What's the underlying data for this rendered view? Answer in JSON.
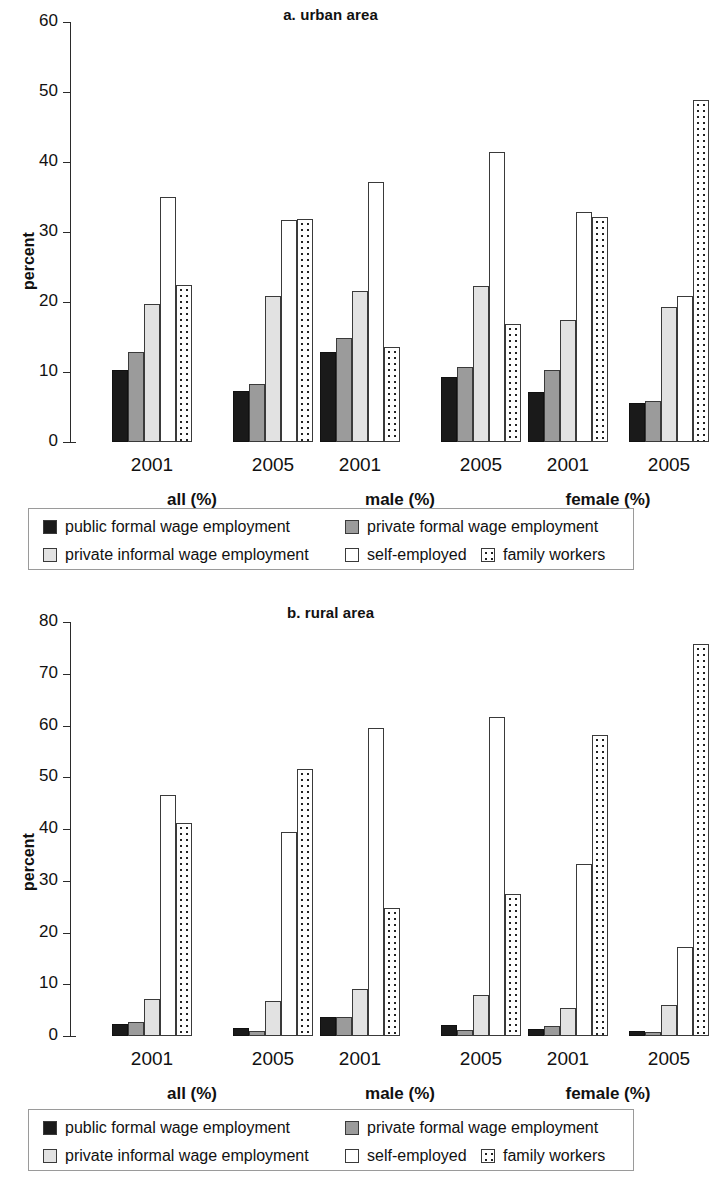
{
  "figure": {
    "ylabel": "percent",
    "series_names": [
      "public formal wage employment",
      "private formal wage employment",
      "private informal wage employment",
      "self-employed",
      "family workers"
    ],
    "series_swatches": [
      "s0",
      "s1",
      "s2",
      "s3",
      "s4"
    ],
    "group_labels": [
      "all (%)",
      "male (%)",
      "female (%)"
    ],
    "year_labels": [
      "2001",
      "2005",
      "2001",
      "2005",
      "2001",
      "2005"
    ]
  },
  "legend": {
    "row1": [
      "public formal wage employment",
      "private formal wage employment"
    ],
    "row2": [
      "private informal wage employment",
      "self-employed",
      "family workers"
    ]
  },
  "chart_data": [
    {
      "type": "bar",
      "title": "a. urban area",
      "xlabel": "",
      "ylabel": "percent",
      "ylim": [
        0,
        60
      ],
      "yticks": [
        0,
        10,
        20,
        30,
        40,
        50,
        60
      ],
      "grid": false,
      "legend_position": "below",
      "categories": [
        "all 2001",
        "all 2005",
        "male 2001",
        "male 2005",
        "female 2001",
        "female 2005"
      ],
      "group_labels": [
        "all (%)",
        "male (%)",
        "female (%)"
      ],
      "year_labels": [
        "2001",
        "2005",
        "2001",
        "2005",
        "2001",
        "2005"
      ],
      "series": [
        {
          "name": "public formal wage employment",
          "values": [
            10.3,
            7.3,
            12.8,
            9.3,
            7.2,
            5.6
          ]
        },
        {
          "name": "private formal wage employment",
          "values": [
            12.8,
            8.3,
            14.9,
            10.7,
            10.3,
            5.9
          ]
        },
        {
          "name": "private informal wage employment",
          "values": [
            19.7,
            20.9,
            21.6,
            22.3,
            17.4,
            19.3
          ]
        },
        {
          "name": "self-employed",
          "values": [
            35.0,
            31.7,
            37.1,
            41.4,
            32.9,
            20.8
          ]
        },
        {
          "name": "family workers",
          "values": [
            22.4,
            31.9,
            13.6,
            16.9,
            32.2,
            48.8
          ]
        }
      ]
    },
    {
      "type": "bar",
      "title": "b. rural area",
      "xlabel": "",
      "ylabel": "percent",
      "ylim": [
        0,
        80
      ],
      "yticks": [
        0,
        10,
        20,
        30,
        40,
        50,
        60,
        70,
        80
      ],
      "grid": false,
      "legend_position": "below",
      "categories": [
        "all 2001",
        "all 2005",
        "male 2001",
        "male 2005",
        "female 2001",
        "female 2005"
      ],
      "group_labels": [
        "all (%)",
        "male (%)",
        "female (%)"
      ],
      "year_labels": [
        "2001",
        "2005",
        "2001",
        "2005",
        "2001",
        "2005"
      ],
      "series": [
        {
          "name": "public formal wage employment",
          "values": [
            2.3,
            1.6,
            3.7,
            2.2,
            1.4,
            0.9
          ]
        },
        {
          "name": "private formal wage employment",
          "values": [
            2.7,
            1.0,
            3.6,
            1.1,
            1.9,
            0.7
          ]
        },
        {
          "name": "private informal wage employment",
          "values": [
            7.2,
            6.8,
            9.1,
            8.0,
            5.4,
            5.9
          ]
        },
        {
          "name": "self-employed",
          "values": [
            46.5,
            39.4,
            59.5,
            61.6,
            33.2,
            17.2
          ]
        },
        {
          "name": "family workers",
          "values": [
            41.1,
            51.6,
            24.7,
            27.4,
            58.2,
            75.8
          ]
        }
      ]
    }
  ]
}
